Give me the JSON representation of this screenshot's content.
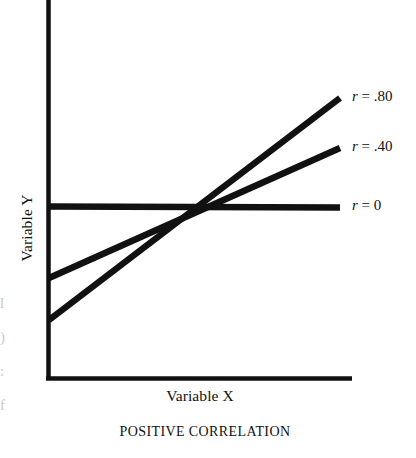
{
  "figure": {
    "caption": "POSITIVE CORRELATION",
    "x_axis_label": "Variable X",
    "y_axis_label": "Variable Y"
  },
  "series_labels": {
    "r80": {
      "symbol": "r",
      "value": "= .80"
    },
    "r40": {
      "symbol": "r",
      "value": "= .40"
    },
    "r0": {
      "symbol": "r",
      "value": "= 0"
    }
  },
  "colors": {
    "ink": "#111111",
    "background": "#ffffff"
  },
  "chart_data": {
    "type": "line",
    "title": "POSITIVE CORRELATION",
    "xlabel": "Variable X",
    "ylabel": "Variable Y",
    "xlim": [
      0,
      1
    ],
    "ylim": [
      0,
      1
    ],
    "grid": false,
    "axis_ticks": false,
    "legend": "right-of-axes inline labels",
    "annotation": "Three regression lines of differing correlation strength, all passing through a common point at the mean of X and Y. Steeper slope indicates stronger positive correlation.",
    "common_intersection": {
      "x": 0.54,
      "y": 0.46
    },
    "series": [
      {
        "name": "r = .80",
        "label": "r = .80",
        "r": 0.8,
        "x": [
          0,
          1
        ],
        "y": [
          0.155,
          0.755
        ],
        "slope_px_per_px": -0.758,
        "endpoints_px": [
          [
            47,
            320
          ],
          [
            340,
            98
          ]
        ]
      },
      {
        "name": "r = .40",
        "label": "r = .40",
        "r": 0.4,
        "x": [
          0,
          1
        ],
        "y": [
          0.266,
          0.608
        ],
        "slope_px_per_px": -0.444,
        "endpoints_px": [
          [
            47,
            278
          ],
          [
            340,
            148
          ]
        ]
      },
      {
        "name": "r = 0",
        "label": "r = 0",
        "r": 0,
        "x": [
          0,
          1
        ],
        "y": [
          0.456,
          0.453
        ],
        "slope_px_per_px": 0.0,
        "endpoints_px": [
          [
            47,
            206
          ],
          [
            340,
            207
          ]
        ]
      }
    ]
  },
  "edge_fragments": [
    "l",
    ")",
    ":",
    "f",
    "e"
  ]
}
